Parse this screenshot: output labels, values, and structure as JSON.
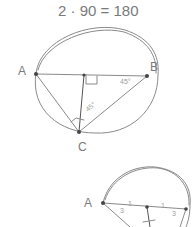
{
  "equation": "2 · 90 = 180",
  "diagram1": {
    "points": [
      {
        "label": "A"
      },
      {
        "label": "B"
      },
      {
        "label": "C"
      }
    ],
    "angle_marks": [
      "45°",
      "45°"
    ],
    "right_angle": true
  },
  "diagram2": {
    "points": [
      {
        "label": "A"
      }
    ],
    "tick_marks": [
      "1",
      "1"
    ],
    "angle_marks": [
      "3",
      "3"
    ]
  }
}
